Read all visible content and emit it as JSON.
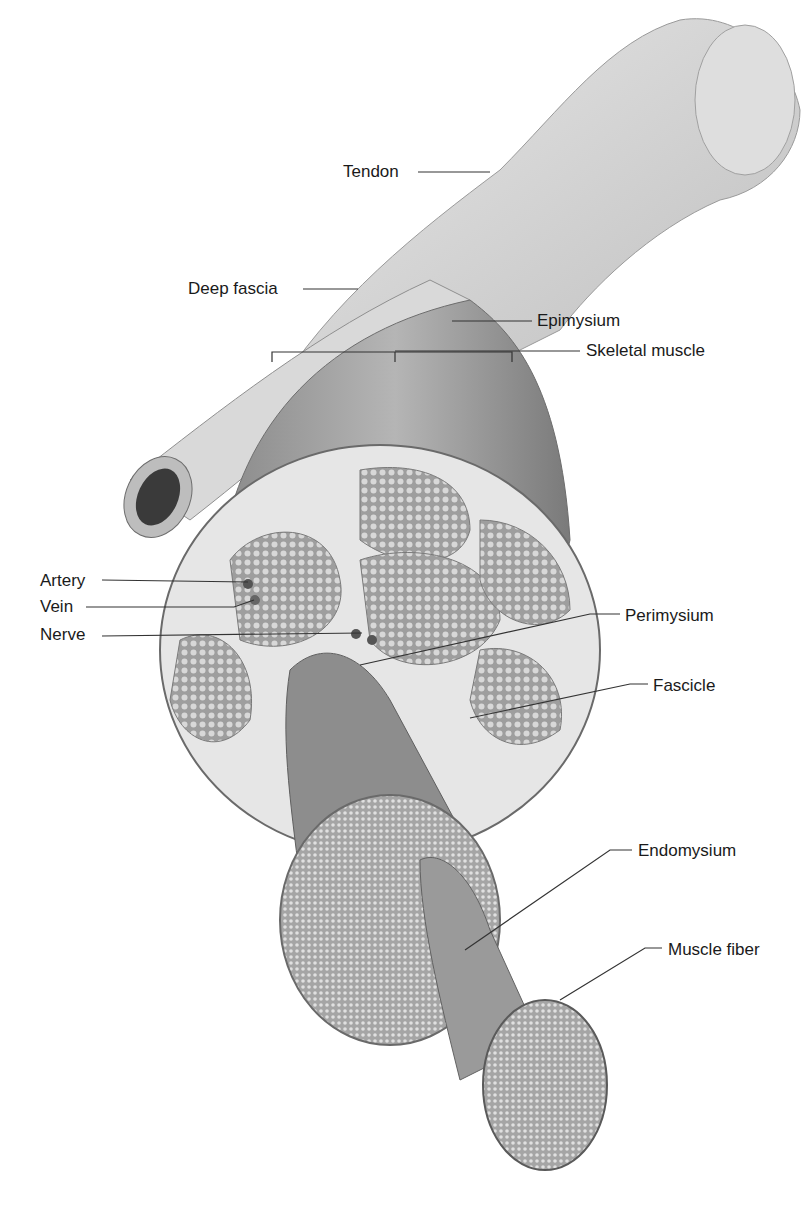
{
  "diagram": {
    "colors": {
      "ink": "#1a1a1a",
      "leader": "#333333",
      "muscle_dark": "#6f6f6f",
      "muscle_mid": "#9a9a9a",
      "tissue_light": "#e6e6e6",
      "tendon": "#cfcfcf"
    },
    "labels": [
      {
        "id": "tendon",
        "text": "Tendon",
        "x": 343,
        "y": 162
      },
      {
        "id": "deep-fascia",
        "text": "Deep fascia",
        "x": 188,
        "y": 279
      },
      {
        "id": "epimysium",
        "text": "Epimysium",
        "x": 537,
        "y": 311
      },
      {
        "id": "skeletal-muscle",
        "text": "Skeletal muscle",
        "x": 586,
        "y": 341
      },
      {
        "id": "artery",
        "text": "Artery",
        "x": 40,
        "y": 571
      },
      {
        "id": "vein",
        "text": "Vein",
        "x": 40,
        "y": 597
      },
      {
        "id": "nerve",
        "text": "Nerve",
        "x": 40,
        "y": 625
      },
      {
        "id": "perimysium",
        "text": "Perimysium",
        "x": 625,
        "y": 606
      },
      {
        "id": "fascicle",
        "text": "Fascicle",
        "x": 653,
        "y": 676
      },
      {
        "id": "endomysium",
        "text": "Endomysium",
        "x": 638,
        "y": 841
      },
      {
        "id": "muscle-fiber",
        "text": "Muscle fiber",
        "x": 668,
        "y": 940
      }
    ]
  }
}
